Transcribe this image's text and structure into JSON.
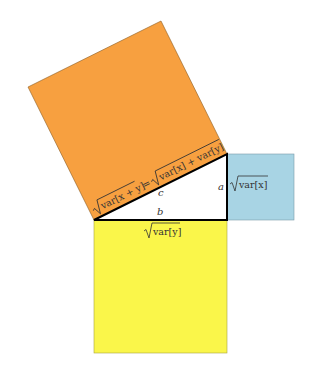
{
  "diagram": {
    "colors": {
      "hypotenuse_square": "#F7A040",
      "side_a_square": "#A8D4E4",
      "side_b_square": "#FAF64A",
      "triangle": "#FFFFFF",
      "stroke": "#000000",
      "text": "#333333"
    },
    "triangle": {
      "vertices": [
        [
          94,
          220
        ],
        [
          227,
          154
        ],
        [
          227,
          220
        ]
      ],
      "labels": {
        "a": "a",
        "b": "b",
        "c": "c"
      }
    },
    "squares": {
      "hypotenuse": {
        "corners": [
          [
            94,
            220
          ],
          [
            227,
            154
          ],
          [
            161,
            21
          ],
          [
            28,
            87
          ]
        ],
        "label_parts": {
          "lhs_radicand": "var[x + y]",
          "equals": "=",
          "rhs_radicand": "var[x] + var[y]"
        }
      },
      "side_a": {
        "rect": [
          227,
          154,
          67,
          66
        ],
        "label_radicand": "var[x]"
      },
      "side_b": {
        "rect": [
          94,
          220,
          133,
          133
        ],
        "label_radicand": "var[y]"
      }
    }
  }
}
